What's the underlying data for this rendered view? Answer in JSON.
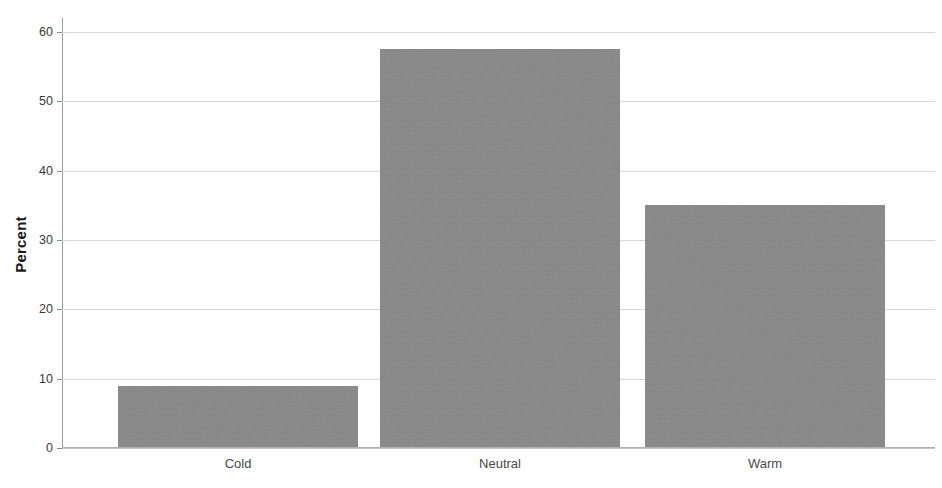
{
  "chart_data": {
    "type": "bar",
    "title": "",
    "xlabel": "",
    "ylabel": "Percent",
    "categories": [
      "Cold",
      "Neutral",
      "Warm"
    ],
    "values": [
      8.8,
      57.4,
      34.9
    ],
    "ylim": [
      0,
      62
    ],
    "yticks": [
      0,
      10,
      20,
      30,
      40,
      50,
      60
    ],
    "ytick_labels": [
      "0",
      "10",
      "20",
      "30",
      "40",
      "50",
      "60"
    ],
    "grid": true,
    "legend": null,
    "bar_color": "#8b8b8b",
    "gridline_color": "#d8d8d8",
    "axis_color": "#9a9a9a",
    "background": "#ffffff"
  },
  "axes": {
    "y_title": "Percent"
  }
}
